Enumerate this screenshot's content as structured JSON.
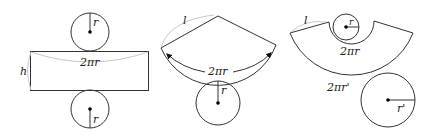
{
  "figure": {
    "cylinder_net": {
      "top_circle_radius_label": "r",
      "side_length_label": "2πr",
      "height_label": "h",
      "bottom_circle_radius_label": "r"
    },
    "cone_net": {
      "slant_label": "l",
      "arc_length_label": "2πr",
      "base_radius_label": "r"
    },
    "frustum_net": {
      "slant_label": "l",
      "inner_arc_label": "2πr",
      "small_circle_radius_label": "r",
      "outer_arc_label": "2πr'",
      "large_circle_radius_label": "r'"
    }
  },
  "colors": {
    "stroke": "#333333",
    "faint": "#c8c8c8",
    "background": "#ffffff"
  }
}
